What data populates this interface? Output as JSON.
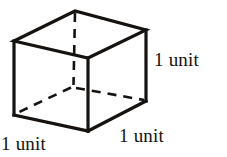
{
  "figure": {
    "name": "unit-cube-diagram",
    "background_color": "#ffffff",
    "stroke_color": "#15120f",
    "labels": {
      "right_edge": "1 unit",
      "bottom_left_edge": "1 unit",
      "bottom_right_edge": "1 unit"
    },
    "geometry": {
      "solid_stroke_width": 3.2,
      "dashed_stroke_width": 2.6,
      "dash_pattern": "9 7",
      "vertices": {
        "top_back": [
          75,
          11
        ],
        "top_left": [
          14,
          41
        ],
        "top_front": [
          88,
          58
        ],
        "top_right": [
          146,
          30
        ],
        "bottom_left": [
          14,
          115
        ],
        "bottom_front": [
          88,
          131
        ],
        "bottom_right": [
          146,
          101
        ],
        "bottom_back_hidden": [
          73,
          87
        ]
      },
      "solid_edges": [
        [
          "top_back",
          "top_left"
        ],
        [
          "top_left",
          "top_front"
        ],
        [
          "top_front",
          "top_right"
        ],
        [
          "top_right",
          "top_back"
        ],
        [
          "top_left",
          "bottom_left"
        ],
        [
          "top_front",
          "bottom_front"
        ],
        [
          "top_right",
          "bottom_right"
        ],
        [
          "bottom_left",
          "bottom_front"
        ],
        [
          "bottom_front",
          "bottom_right"
        ]
      ],
      "dashed_edges": [
        [
          "top_back",
          "bottom_back_hidden"
        ],
        [
          "bottom_back_hidden",
          "bottom_left"
        ],
        [
          "bottom_back_hidden",
          "bottom_right"
        ]
      ]
    }
  }
}
